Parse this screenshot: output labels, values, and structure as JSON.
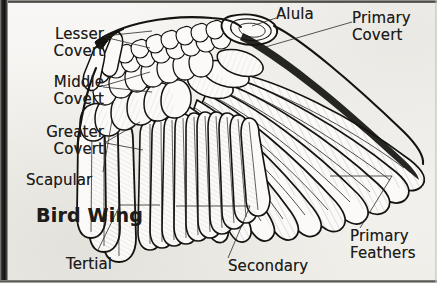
{
  "figure": {
    "title": "Bird Wing",
    "style": "black and white line illustration",
    "background_color": "#f6f5f2",
    "ink_color": "#1d1c1a",
    "border_color": "#121211"
  },
  "labels": {
    "lesser_covert": "Lesser\nCovert",
    "middle_covert": "Middle\nCovert",
    "greater_covert": "Greater\nCovert",
    "scapular": "Scapular",
    "title": "Bird Wing",
    "tertial": "Tertial",
    "secondary": "Secondary",
    "alula": "Alula",
    "primary_covert": "Primary\nCovert",
    "primary_feathers": "Primary\nFeathers"
  },
  "label_list": [
    {
      "key": "lesser_covert",
      "text": "Lesser Covert",
      "side": "left"
    },
    {
      "key": "middle_covert",
      "text": "Middle Covert",
      "side": "left"
    },
    {
      "key": "greater_covert",
      "text": "Greater Covert",
      "side": "left"
    },
    {
      "key": "scapular",
      "text": "Scapular",
      "side": "left"
    },
    {
      "key": "tertial",
      "text": "Tertial",
      "side": "bottom"
    },
    {
      "key": "secondary",
      "text": "Secondary",
      "side": "bottom"
    },
    {
      "key": "alula",
      "text": "Alula",
      "side": "top"
    },
    {
      "key": "primary_covert",
      "text": "Primary Covert",
      "side": "top-right"
    },
    {
      "key": "primary_feathers",
      "text": "Primary Feathers",
      "side": "bottom-right"
    }
  ]
}
